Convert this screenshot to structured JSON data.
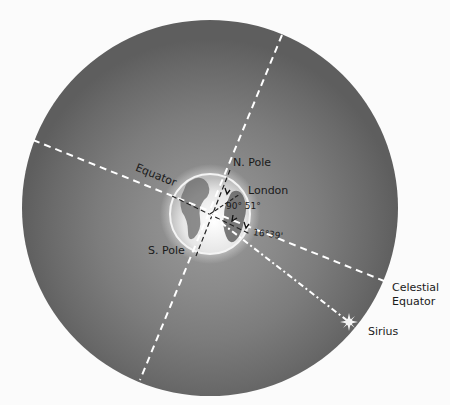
{
  "diagram": {
    "labels": {
      "north_pole": "N. Pole",
      "south_pole": "S. Pole",
      "equator": "Equator",
      "london": "London",
      "angle_london": "90° 51°",
      "angle_sirius": "16°39'",
      "celestial_equator_line1": "Celestial",
      "celestial_equator_line2": "Equator",
      "sirius": "Sirius"
    },
    "colors": {
      "celestial_sphere": "#6e6e6e",
      "sphere_glow": "#8a8a8a",
      "globe": "#e8e8e8",
      "lines": "#ffffff",
      "text": "#1a1a1a",
      "background": "#fbfbfb"
    },
    "icons": {
      "sirius_star": "eight-point-star"
    }
  }
}
